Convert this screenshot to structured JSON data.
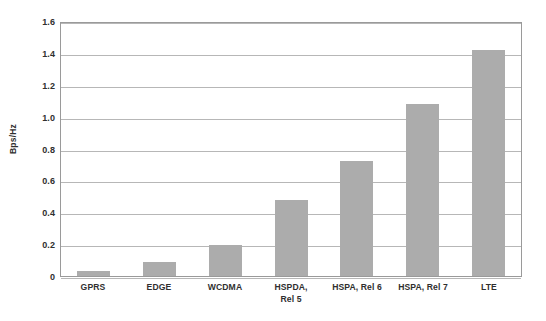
{
  "chart_data": {
    "type": "bar",
    "title": "",
    "subtitle": "",
    "xlabel": "",
    "ylabel": "Bps/Hz",
    "categories": [
      "GPRS",
      "EDGE",
      "WCDMA",
      "HSPDA,\nRel 5",
      "HSPA, Rel 6",
      "HSPA, Rel 7",
      "LTE"
    ],
    "values": [
      0.03,
      0.09,
      0.195,
      0.48,
      0.72,
      1.08,
      1.42
    ],
    "ylim": [
      0,
      1.6
    ],
    "ytick_labels": [
      "1.6",
      "1.4",
      "1.2",
      "1.0",
      "0.8",
      "0.6",
      "0.4",
      "0.2",
      "0"
    ],
    "ytick_values": [
      1.6,
      1.4,
      1.2,
      1.0,
      0.8,
      0.6,
      0.4,
      0.2,
      0
    ],
    "grid": true,
    "grid_axis": "y",
    "legend": false,
    "legend_position": "none",
    "bar_color": "#acacac",
    "gridline_color": "#b7b7b7",
    "axis_color": "#9a9a9a",
    "background_color": "#ffffff",
    "text_color": "#2f2f2f"
  }
}
